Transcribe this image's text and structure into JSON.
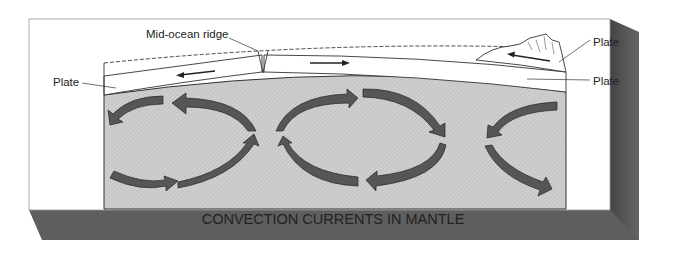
{
  "diagram": {
    "title": "CONVECTION CURRENTS IN MANTLE",
    "labels": {
      "ridge": "Mid-ocean ridge",
      "plate_left": "Plate",
      "plate_right_top": "Plate",
      "plate_right_bottom": "Plate"
    },
    "colors": {
      "mantle_fill": "#c8c8c8",
      "arrow_fill": "#555555",
      "shadow": "#5a5a5a",
      "card": "#ffffff"
    }
  }
}
